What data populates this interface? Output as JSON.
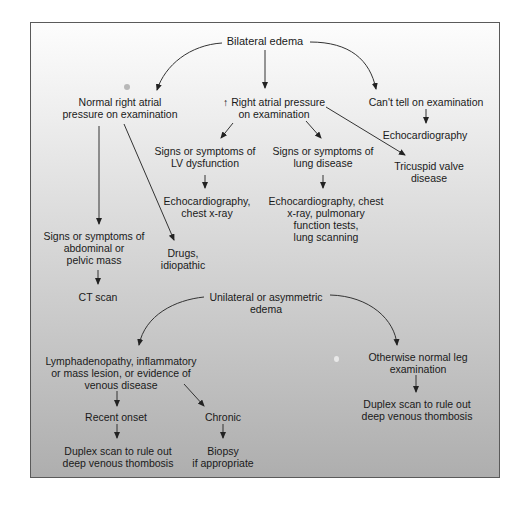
{
  "diagram": {
    "type": "flowchart",
    "background": {
      "top": "#fdfdfd",
      "bottom": "#aeaeae",
      "border": "#5a5a5a"
    },
    "nodes": {
      "bilateral": {
        "lines": [
          "Bilateral edema"
        ]
      },
      "normal_rap": {
        "lines": [
          "Normal right atrial",
          "pressure on examination"
        ]
      },
      "high_rap": {
        "prefix_icon": "up-arrow",
        "lines": [
          "Right atrial pressure",
          "on examination"
        ],
        "arrow_glyph": "↑"
      },
      "cant_tell": {
        "lines": [
          "Can't tell on examination"
        ]
      },
      "echo1": {
        "lines": [
          "Echocardiography"
        ]
      },
      "lv": {
        "lines": [
          "Signs or symptoms of",
          "LV dysfunction"
        ]
      },
      "lung": {
        "lines": [
          "Signs or symptoms of",
          "lung disease"
        ]
      },
      "tricuspid": {
        "lines": [
          "Tricuspid valve",
          "disease"
        ]
      },
      "echo_cxr": {
        "lines": [
          "Echocardiography,",
          "chest x-ray"
        ]
      },
      "lung_tests": {
        "lines": [
          "Echocardiography, chest",
          "x-ray, pulmonary",
          "function tests,",
          "lung scanning"
        ]
      },
      "abdominal": {
        "lines": [
          "Signs or symptoms of",
          "abdominal or",
          "pelvic mass"
        ]
      },
      "drugs": {
        "lines": [
          "Drugs,",
          "idiopathic"
        ]
      },
      "ct": {
        "lines": [
          "CT scan"
        ]
      },
      "unilateral": {
        "lines": [
          "Unilateral or asymmetric",
          "edema"
        ]
      },
      "lymph": {
        "lines": [
          "Lymphadenopathy, inflammatory",
          "or mass lesion, or evidence of",
          "venous disease"
        ]
      },
      "normal_leg": {
        "lines": [
          "Otherwise normal leg",
          "examination"
        ]
      },
      "recent": {
        "lines": [
          "Recent onset"
        ]
      },
      "chronic": {
        "lines": [
          "Chronic"
        ]
      },
      "duplex_left": {
        "lines": [
          "Duplex scan to rule out",
          "deep venous thombosis"
        ]
      },
      "biopsy": {
        "lines": [
          "Biopsy",
          "if appropriate"
        ]
      },
      "duplex_right": {
        "lines": [
          "Duplex scan to rule out",
          "deep venous thombosis"
        ]
      }
    },
    "edges": [
      {
        "from": "bilateral",
        "to": "normal_rap"
      },
      {
        "from": "bilateral",
        "to": "high_rap"
      },
      {
        "from": "bilateral",
        "to": "cant_tell"
      },
      {
        "from": "cant_tell",
        "to": "echo1"
      },
      {
        "from": "high_rap",
        "to": "lv"
      },
      {
        "from": "high_rap",
        "to": "lung"
      },
      {
        "from": "high_rap",
        "to": "tricuspid"
      },
      {
        "from": "lv",
        "to": "echo_cxr"
      },
      {
        "from": "lung",
        "to": "lung_tests"
      },
      {
        "from": "normal_rap",
        "to": "abdominal"
      },
      {
        "from": "normal_rap",
        "to": "drugs"
      },
      {
        "from": "abdominal",
        "to": "ct"
      },
      {
        "from": "unilateral",
        "to": "lymph"
      },
      {
        "from": "unilateral",
        "to": "normal_leg"
      },
      {
        "from": "lymph",
        "to": "recent"
      },
      {
        "from": "lymph",
        "to": "chronic"
      },
      {
        "from": "recent",
        "to": "duplex_left"
      },
      {
        "from": "chronic",
        "to": "biopsy"
      },
      {
        "from": "normal_leg",
        "to": "duplex_right"
      }
    ]
  }
}
